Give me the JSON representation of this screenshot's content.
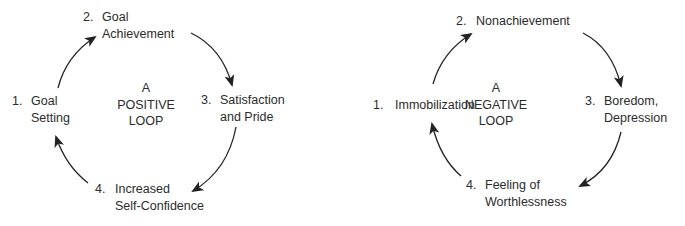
{
  "positive_loop": {
    "title_lines": [
      "A",
      "POSITIVE",
      "LOOP"
    ],
    "steps": [
      {
        "number": "1.",
        "lines": [
          "Goal",
          "Setting"
        ]
      },
      {
        "number": "2.",
        "lines": [
          "Goal",
          "Achievement"
        ]
      },
      {
        "number": "3.",
        "lines": [
          "Satisfaction",
          "and Pride"
        ]
      },
      {
        "number": "4.",
        "lines": [
          "Increased",
          "Self-Confidence"
        ]
      }
    ]
  },
  "negative_loop": {
    "title_lines": [
      "A",
      "NEGATIVE",
      "LOOP"
    ],
    "steps": [
      {
        "number": "1.",
        "lines": [
          "Immobilization"
        ]
      },
      {
        "number": "2.",
        "lines": [
          "Nonachievement"
        ]
      },
      {
        "number": "3.",
        "lines": [
          "Boredom,",
          "Depression"
        ]
      },
      {
        "number": "4.",
        "lines": [
          "Feeling of",
          "Worthlessness"
        ]
      }
    ]
  },
  "colors": {
    "text": "#2b2b2b",
    "arrow": "#222222",
    "background": "#ffffff"
  }
}
